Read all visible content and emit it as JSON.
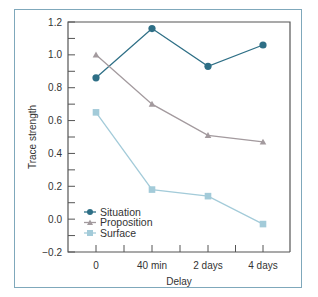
{
  "chart_data": {
    "type": "line",
    "title": "",
    "xlabel": "Delay",
    "ylabel": "Trace strength",
    "categories": [
      "0",
      "40 min",
      "2 days",
      "4 days"
    ],
    "ylim": [
      -0.2,
      1.2
    ],
    "yticks": [
      "1.2",
      "1.0",
      "0.8",
      "0.6",
      "0.4",
      "0.2",
      "0.0",
      "−0.2"
    ],
    "grid": false,
    "legend_position": "lower left",
    "series": [
      {
        "name": "Situation",
        "marker": "circle",
        "color": "#2e6f86",
        "values": [
          0.86,
          1.16,
          0.93,
          1.06
        ]
      },
      {
        "name": "Proposition",
        "marker": "triangle",
        "color": "#a39a9e",
        "values": [
          1.0,
          0.7,
          0.51,
          0.47
        ]
      },
      {
        "name": "Surface",
        "marker": "square",
        "color": "#a3cbd9",
        "values": [
          0.65,
          0.18,
          0.14,
          -0.03
        ]
      }
    ]
  }
}
